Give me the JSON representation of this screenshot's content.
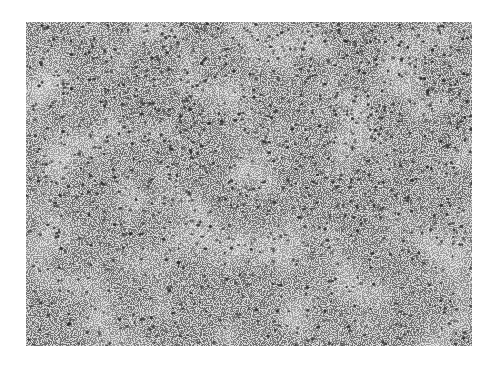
{
  "image": {
    "type": "histology micrograph",
    "description": "Grayscale photomicrograph of densely cellular tissue with scattered dark nuclei on pale background",
    "colors": {
      "background": "#ffffff",
      "tissue": "#e6e6e6",
      "nuclei": "#2a2a2a"
    },
    "frame": {
      "x": 26,
      "y": 22,
      "width": 446,
      "height": 324
    }
  }
}
